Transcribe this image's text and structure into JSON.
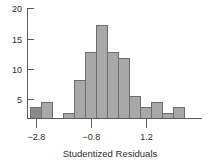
{
  "chart_data": {
    "type": "bar",
    "title": "",
    "subtitle": "",
    "xlabel": "Studentized Residuals",
    "ylabel": "",
    "grid": false,
    "legend": false,
    "bin_width": 0.4,
    "xlim": [
      -3.2,
      2.4
    ],
    "ylim": [
      0,
      20
    ],
    "x_ticks": [
      -2.8,
      -0.8,
      1.2
    ],
    "x_tick_labels": [
      "−2.8",
      "−0.8",
      "1.2"
    ],
    "y_ticks": [
      5,
      10,
      15,
      20
    ],
    "y_tick_labels": [
      "5",
      "10",
      "15",
      "20"
    ],
    "categories": [
      "-3.0",
      "-2.6",
      "-2.2",
      "-1.8",
      "-1.4",
      "-1.0",
      "-0.6",
      "-0.2",
      "0.2",
      "0.6",
      "1.0",
      "1.4",
      "1.8",
      "2.2"
    ],
    "bin_centers": [
      -3.0,
      -2.6,
      -2.2,
      -1.8,
      -1.4,
      -1.0,
      -0.6,
      -0.2,
      0.2,
      0.6,
      1.0,
      1.4,
      1.8,
      2.2
    ],
    "values": [
      2,
      3,
      0,
      1,
      7,
      12,
      17,
      12,
      11,
      4,
      2,
      3,
      1,
      2
    ],
    "highlight_index": 0,
    "colors": {
      "bar_fill": "#a8a8a8",
      "bar_accent_fill": "#8a8a8a",
      "bar_stroke": "#6d6d6d",
      "axis": "#5a5a5a",
      "text": "#2b2b2b",
      "background": "#ffffff"
    }
  }
}
